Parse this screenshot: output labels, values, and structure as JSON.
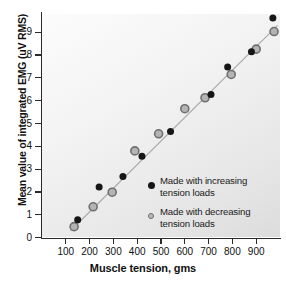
{
  "chart_data": {
    "type": "scatter",
    "title": "",
    "xlabel": "Muscle tension, gms",
    "ylabel": "Mean value of integrated EMG (uV RMS)",
    "xlim": [
      0,
      1000
    ],
    "ylim": [
      0,
      9.8
    ],
    "xticks": [
      100,
      200,
      300,
      400,
      500,
      600,
      700,
      800,
      900
    ],
    "yticks": [
      0,
      1,
      2,
      3,
      4,
      5,
      6,
      7,
      8,
      9
    ],
    "grid": false,
    "legend_position": "inside lower-right",
    "series": [
      {
        "name": "Made with increasing tension loads",
        "marker": "filled-circle",
        "color": "#161616",
        "points": [
          [
            150,
            0.78
          ],
          [
            240,
            2.22
          ],
          [
            340,
            2.68
          ],
          [
            420,
            3.57
          ],
          [
            540,
            4.65
          ],
          [
            710,
            6.27
          ],
          [
            780,
            7.48
          ],
          [
            880,
            8.15
          ],
          [
            970,
            9.62
          ]
        ]
      },
      {
        "name": "Made with decreasing tension loads",
        "marker": "open-circle",
        "color": "#b4b4b4",
        "points": [
          [
            135,
            0.48
          ],
          [
            215,
            1.35
          ],
          [
            295,
            1.99
          ],
          [
            390,
            3.8
          ],
          [
            490,
            4.55
          ],
          [
            600,
            5.65
          ],
          [
            685,
            6.13
          ],
          [
            795,
            7.15
          ],
          [
            900,
            8.26
          ],
          [
            975,
            9.03
          ]
        ]
      }
    ],
    "fit_line": {
      "name": "regression-line",
      "color": "#a9a9a9",
      "x": [
        120,
        990
      ],
      "y": [
        0.3,
        9.3
      ]
    }
  },
  "legend": {
    "entries": [
      {
        "marker": "filled-circle",
        "line1": "Made with increasing",
        "line2": "tension loads"
      },
      {
        "marker": "open-circle",
        "line1": "Made with decreasing",
        "line2": "tension loads"
      }
    ]
  }
}
